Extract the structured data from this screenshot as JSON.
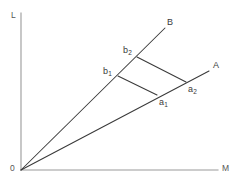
{
  "figure": {
    "width": 240,
    "height": 179,
    "background": "#ffffff",
    "line_color": "#3a3a3a",
    "axis_color": "#9a9a9a",
    "label_color": "#3a3a3a"
  },
  "axes": {
    "vertical": {
      "label": "L",
      "label_x": 11,
      "label_y": 11,
      "x": 21,
      "y_top": 13,
      "y_bottom": 170
    },
    "horizontal": {
      "label": "M",
      "label_x": 222,
      "label_y": 164,
      "y": 170,
      "x_left": 21,
      "x_right": 218
    },
    "origin": {
      "label": "0",
      "label_x": 10,
      "label_y": 164,
      "x": 21,
      "y": 170
    }
  },
  "rays": [
    {
      "name": "ray-B",
      "label": "B",
      "label_x": 167,
      "label_y": 18,
      "from_x": 21,
      "from_y": 170,
      "to_x": 165,
      "to_y": 28
    },
    {
      "name": "ray-A",
      "label": "A",
      "label_x": 213,
      "label_y": 61,
      "from_x": 21,
      "from_y": 170,
      "to_x": 209,
      "to_y": 71
    }
  ],
  "points": [
    {
      "name": "point-b1",
      "label_main": "b",
      "label_sub": "1",
      "x": 118,
      "y": 76,
      "label_x": 103,
      "label_y": 67
    },
    {
      "name": "point-b2",
      "label_main": "b",
      "label_sub": "2",
      "x": 137,
      "y": 57,
      "label_x": 123,
      "label_y": 46
    },
    {
      "name": "point-a1",
      "label_main": "a",
      "label_sub": "1",
      "x": 157,
      "y": 95,
      "label_x": 159,
      "label_y": 98
    },
    {
      "name": "point-a2",
      "label_main": "a",
      "label_sub": "2",
      "x": 186,
      "y": 82,
      "label_x": 188,
      "label_y": 85
    }
  ],
  "connectors": [
    {
      "name": "segment-b1-a1",
      "x1": 118,
      "y1": 76,
      "x2": 157,
      "y2": 95
    },
    {
      "name": "segment-b2-a2",
      "x1": 137,
      "y1": 57,
      "x2": 186,
      "y2": 82
    }
  ],
  "chart_data": {
    "type": "diagram",
    "title": "",
    "xlabel": "M",
    "ylabel": "L",
    "series": [
      {
        "name": "B",
        "points": [
          {
            "label": "O",
            "x": 21,
            "y": 170
          },
          {
            "label": "b1",
            "x": 118,
            "y": 76
          },
          {
            "label": "b2",
            "x": 137,
            "y": 57
          },
          {
            "label": "B",
            "x": 165,
            "y": 28
          }
        ]
      },
      {
        "name": "A",
        "points": [
          {
            "label": "O",
            "x": 21,
            "y": 170
          },
          {
            "label": "a1",
            "x": 157,
            "y": 95
          },
          {
            "label": "a2",
            "x": 186,
            "y": 82
          },
          {
            "label": "A",
            "x": 209,
            "y": 71
          }
        ]
      }
    ]
  }
}
